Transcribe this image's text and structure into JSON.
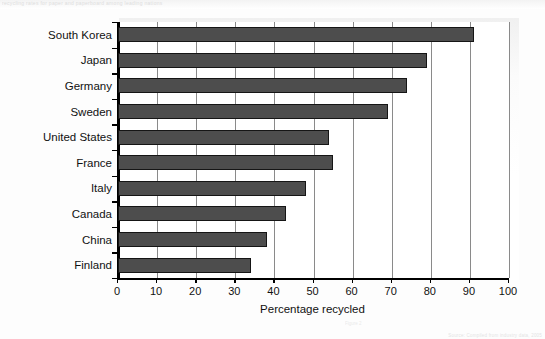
{
  "page": {
    "header_text": "recycling rates for paper and paperboard among leading nations",
    "footer_text": "Source: Compiled from industry data, 2005",
    "footnote_text": "Figure 2"
  },
  "chart_data": {
    "type": "bar",
    "orientation": "horizontal",
    "title": "",
    "xlabel": "Percentage recycled",
    "ylabel": "",
    "categories": [
      "South Korea",
      "Japan",
      "Germany",
      "Sweden",
      "United States",
      "France",
      "Italy",
      "Canada",
      "China",
      "Finland"
    ],
    "values": [
      91,
      79,
      74,
      69,
      54,
      55,
      48,
      43,
      38,
      34
    ],
    "xlim": [
      0,
      100
    ],
    "xticks": [
      0,
      10,
      20,
      30,
      40,
      50,
      60,
      70,
      80,
      90,
      100
    ],
    "xtick_labels": [
      "0",
      "10",
      "20",
      "30",
      "40",
      "50",
      "60",
      "70",
      "80",
      "90",
      "100"
    ],
    "grid": "vertical",
    "legend": "none",
    "bar_color": "#4d4d4d",
    "bar_edge_color": "#151515"
  }
}
